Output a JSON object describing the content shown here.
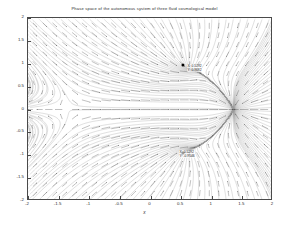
{
  "figure": {
    "title": "Phase space of the autonomous system  of three fluid cosmological model",
    "xaxis_label": "x",
    "background": "#ffffff",
    "axis_color": "#4a4a4a",
    "field_color": "#555555"
  },
  "axes": {
    "x_ticks": [
      "-2",
      "-1.5",
      "-1",
      "-0.5",
      "0",
      "0.5",
      "1",
      "1.5",
      "2"
    ],
    "x_tick_values": [
      -2,
      -1.5,
      -1,
      -0.5,
      0,
      0.5,
      1,
      1.5,
      2
    ],
    "y_ticks": [
      "2",
      "1.5",
      "1",
      "0.5",
      "0",
      "-0.5",
      "-1",
      "-1.5",
      "-2"
    ],
    "y_tick_values": [
      2,
      1.5,
      1,
      0.5,
      0,
      -0.5,
      -1,
      -1.5,
      -2
    ],
    "xlim": [
      -2,
      2
    ],
    "ylim": [
      -2,
      2
    ],
    "grid": false
  },
  "annotations": [
    {
      "name": "upper-fixed-point-label",
      "x": 0.55,
      "y": 0.95,
      "line1": "X: 0.5292",
      "line2": "Y: 0.9682"
    },
    {
      "name": "lower-fixed-point-label",
      "x": 0.42,
      "y": -0.92,
      "line1": "X: 0.5292",
      "line2": "Y: -0.9546"
    }
  ],
  "chart_data": {
    "type": "scatter",
    "title": "Phase space of the autonomous system  of three fluid cosmological model",
    "xlabel": "x",
    "ylabel": "",
    "xlim": [
      -2,
      2
    ],
    "ylim": [
      -2,
      2
    ],
    "grid": false,
    "legend": null,
    "plot_style": "vector field / phase portrait (quiver with streamlines)",
    "fixed_points": [
      {
        "x": 0.53,
        "y": 0.97,
        "type": "spiral-node",
        "labelled": true
      },
      {
        "x": 0.53,
        "y": -0.95,
        "type": "spiral-node",
        "labelled": true
      },
      {
        "x": -1.28,
        "y": 0.0,
        "type": "saddle",
        "labelled": false
      },
      {
        "x": 1.35,
        "y": 0.0,
        "type": "node",
        "labelled": false
      }
    ],
    "separatrices": [
      {
        "description": "horizontal invariant line y = 0"
      },
      {
        "description": "near-vertical inflow toward x = -1.28"
      }
    ],
    "vector_field": {
      "description": "Arrows flow outward from the saddle near x=-1.28 along y=0, sweep around the two spiral nodes at y=+/-0.97, and converge toward x=1.35 on the right.",
      "arrow_grid_nx": 25,
      "arrow_grid_ny": 19
    }
  }
}
